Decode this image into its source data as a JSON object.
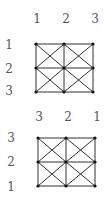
{
  "figures": [
    {
      "name": "grid-top",
      "column_labels": [
        "1",
        "2",
        "3"
      ],
      "row_labels": [
        "1",
        "2",
        "3"
      ],
      "col_x": [
        36,
        64,
        93
      ],
      "row_y": [
        44,
        68,
        92
      ],
      "col_label_x": [
        37,
        66,
        95
      ],
      "col_label_y": 19,
      "row_label_x": 9,
      "row_label_y": [
        45,
        69,
        91
      ]
    },
    {
      "name": "grid-bottom",
      "column_labels": [
        "3",
        "2",
        "1"
      ],
      "row_labels": [
        "3",
        "2",
        "1"
      ],
      "col_x": [
        38,
        66,
        95
      ],
      "row_y": [
        138,
        162,
        186
      ],
      "col_label_x": [
        39,
        68,
        97
      ],
      "col_label_y": 117,
      "row_label_x": 11,
      "row_label_y": [
        138,
        162,
        187
      ]
    }
  ],
  "colors": {
    "line": "#333333",
    "vertex": "#111111",
    "label": "#555555"
  }
}
